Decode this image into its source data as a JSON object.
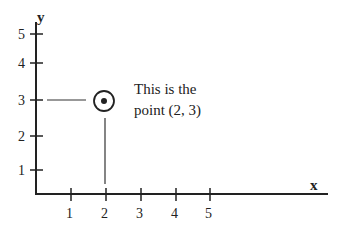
{
  "diagram": {
    "type": "coordinate-plane",
    "x_axis_label": "x",
    "y_axis_label": "y",
    "x_ticks": [
      "1",
      "2",
      "3",
      "4",
      "5"
    ],
    "y_ticks": [
      "1",
      "2",
      "3",
      "4",
      "5"
    ],
    "point": {
      "x": 2,
      "y": 3
    },
    "annotation": {
      "line1": "This is the",
      "line2": "point (2, 3)"
    },
    "colors": {
      "ink": "#222222",
      "background": "#ffffff"
    }
  }
}
